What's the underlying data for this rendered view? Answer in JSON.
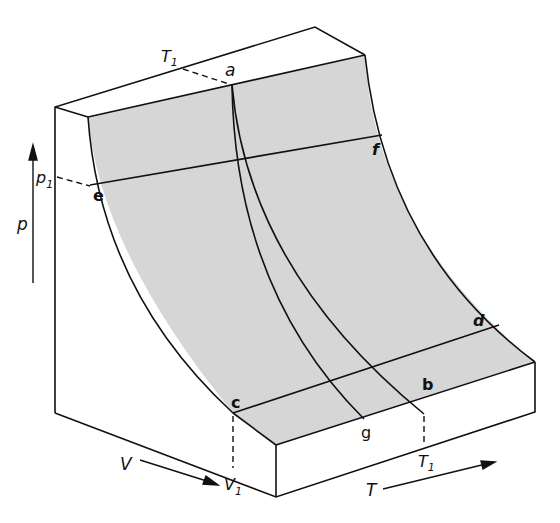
{
  "diagram": {
    "axes": {
      "pressure": {
        "label": "p",
        "marker": "p",
        "marker_sub": "1"
      },
      "volume": {
        "label": "V",
        "marker": "V",
        "marker_sub": "1"
      },
      "temperature": {
        "label": "T",
        "marker": "T",
        "marker_sub": "1"
      },
      "temperature_top": {
        "marker": "T",
        "marker_sub": "1"
      }
    },
    "points": {
      "a": "a",
      "b": "b",
      "c": "c",
      "d": "d",
      "e": "e",
      "f": "f",
      "g": "g"
    },
    "colors": {
      "surface": "#d9d9d9",
      "lines": "#111111",
      "background": "#ffffff"
    }
  }
}
